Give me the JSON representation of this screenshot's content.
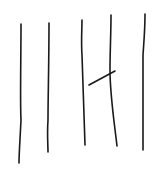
{
  "sketch": {
    "description": "Hand-drawn tally-like strokes",
    "stroke_color": "#1a1a1a",
    "background": "#ffffff",
    "strokes": [
      {
        "name": "vertical-stroke-1",
        "d": "M21,24 C21,60 20,100 21,120 C20,140 19,155 19,163"
      },
      {
        "name": "vertical-stroke-2",
        "d": "M49,23 C49,60 48,100 48,120 C47,135 48,145 48,152"
      },
      {
        "name": "vertical-stroke-3",
        "d": "M82,20 C82,30 81,40 82,55 C83,90 84,120 85,145"
      },
      {
        "name": "vertical-stroke-4",
        "d": "M111,15 C111,35 110,50 110,70 C110,95 114,120 117,146"
      },
      {
        "name": "vertical-stroke-5",
        "d": "M145,14 C145,30 144,40 143,55 C143,90 143,120 143,150"
      },
      {
        "name": "diagonal-stroke",
        "d": "M89,85 L115,71"
      }
    ]
  }
}
